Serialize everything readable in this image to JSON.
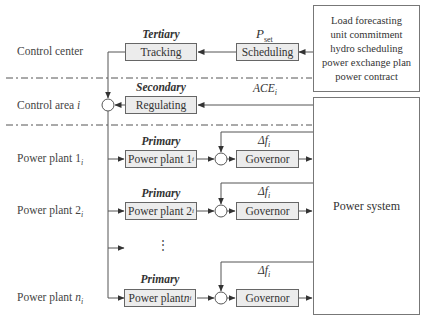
{
  "rows": {
    "control_center": "Control center",
    "control_area": "Control area",
    "control_area_sub": "i",
    "plant1": "Power plant 1",
    "plant2": "Power plant 2",
    "plantn_prefix": "Power plant ",
    "plantn_var": "n",
    "sub_i": "i"
  },
  "levels": {
    "tertiary": "Tertiary",
    "secondary": "Secondary",
    "primary": "Primary"
  },
  "blocks": {
    "tracking": "Tracking",
    "scheduling": "Scheduling",
    "regulating": "Regulating",
    "plant_block_1": "Power plant 1",
    "plant_block_2": "Power plant 2",
    "plant_block_n_prefix": "Power plant ",
    "plant_block_n_var": "n",
    "governor": "Governor",
    "power_system": "Power system"
  },
  "planning_box": {
    "lines": [
      "Load forecasting",
      "unit commitment",
      "hydro scheduling",
      "power exchange plan",
      "power contract"
    ]
  },
  "signals": {
    "p_set_main": "P",
    "p_set_sub": "set",
    "ace_main": "ACE",
    "ace_sub": "i",
    "delta_f": "Δf",
    "delta_f_sub": "i"
  },
  "ellipsis": "⋮"
}
